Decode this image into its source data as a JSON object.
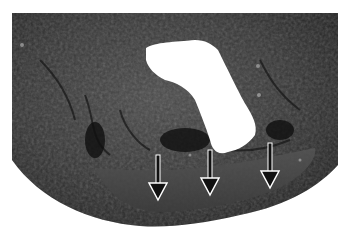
{
  "image": {
    "subject": "gross pathology specimen cross-section with central white cavity",
    "background_color": "#ffffff",
    "tissue_color": "#3a3a3a",
    "cavity_color": "#ffffff"
  },
  "annotations": {
    "arrows": [
      {
        "name": "arrow-left",
        "x": 158,
        "y_start": 155,
        "y_tip": 200
      },
      {
        "name": "arrow-middle",
        "x": 210,
        "y_start": 150,
        "y_tip": 195
      },
      {
        "name": "arrow-right",
        "x": 270,
        "y_start": 143,
        "y_tip": 188
      }
    ],
    "arrow_fill": "#111111",
    "arrow_outline": "#ffffff"
  }
}
